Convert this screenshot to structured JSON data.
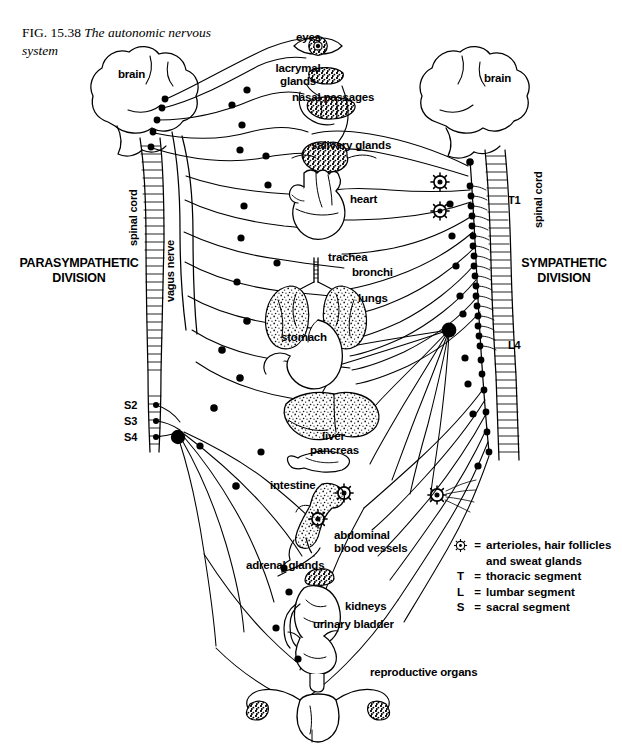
{
  "figure": {
    "number_prefix": "FIG.",
    "number": "15.38",
    "title": "The autonomic nervous system",
    "width": 622,
    "height": 745,
    "background": "#ffffff",
    "ink": "#000000"
  },
  "divisions": [
    {
      "name": "parasympathetic",
      "line1": "PARASYMPATHETIC",
      "line2": "DIVISION",
      "x": 14,
      "y": 256
    },
    {
      "name": "sympathetic",
      "line1": "SYMPATHETIC",
      "line2": "DIVISION",
      "x": 512,
      "y": 256
    }
  ],
  "structures": [
    {
      "name": "brain-left",
      "label": "brain",
      "x": 118,
      "y": 68
    },
    {
      "name": "brain-right",
      "label": "brain",
      "x": 484,
      "y": 72
    },
    {
      "name": "spinal-cord-left",
      "label": "spinal cord",
      "x": 121,
      "y": 200,
      "rotated": true
    },
    {
      "name": "vagus-nerve",
      "label": "vagus nerve",
      "x": 159,
      "y": 258,
      "rotated": true
    },
    {
      "name": "spinal-cord-right",
      "label": "spinal cord",
      "x": 527,
      "y": 165,
      "rotated": true
    },
    {
      "name": "eyes",
      "label": "eyes",
      "x": 296,
      "y": 31
    },
    {
      "name": "lacrymal-glands",
      "label": "lacrymal\nglands",
      "x": 265,
      "y": 62
    },
    {
      "name": "nasal-passages",
      "label": "nasal passages",
      "x": 292,
      "y": 91
    },
    {
      "name": "salivary-glands",
      "label": "salivary glands",
      "x": 311,
      "y": 139
    },
    {
      "name": "heart",
      "label": "heart",
      "x": 350,
      "y": 193
    },
    {
      "name": "trachea",
      "label": "trachea",
      "x": 328,
      "y": 258
    },
    {
      "name": "bronchi",
      "label": "bronchi",
      "x": 352,
      "y": 272
    },
    {
      "name": "lungs",
      "label": "lungs",
      "x": 358,
      "y": 298
    },
    {
      "name": "stomach",
      "label": "stomach",
      "x": 281,
      "y": 333
    },
    {
      "name": "liver",
      "label": "liver",
      "x": 322,
      "y": 430
    },
    {
      "name": "pancreas",
      "label": "pancreas",
      "x": 314,
      "y": 446
    },
    {
      "name": "intestine",
      "label": "intestine",
      "x": 272,
      "y": 484
    },
    {
      "name": "abdominal-blood-vessels",
      "label": "abdominal\nblood vessels",
      "x": 334,
      "y": 533
    },
    {
      "name": "adrenal-glands",
      "label": "adrenal glands",
      "x": 248,
      "y": 563
    },
    {
      "name": "kidneys",
      "label": "kidneys",
      "x": 345,
      "y": 605
    },
    {
      "name": "urinary-bladder",
      "label": "urinary bladder",
      "x": 315,
      "y": 622
    },
    {
      "name": "reproductive-organs",
      "label": "reproductive organs",
      "x": 372,
      "y": 670
    }
  ],
  "segment_markers": [
    {
      "name": "T1",
      "label": "T1",
      "x": 508,
      "y": 194,
      "side": "sympathetic"
    },
    {
      "name": "L4",
      "label": "L4",
      "x": 508,
      "y": 339,
      "side": "sympathetic"
    },
    {
      "name": "S2",
      "label": "S2",
      "x": 124,
      "y": 399,
      "side": "parasympathetic"
    },
    {
      "name": "S3",
      "label": "S3",
      "x": 124,
      "y": 415,
      "side": "parasympathetic"
    },
    {
      "name": "S4",
      "label": "S4",
      "x": 124,
      "y": 431,
      "side": "parasympathetic"
    }
  ],
  "legend": {
    "rows": [
      {
        "symbol": "star-wheel-icon",
        "symbol_text": "",
        "equals": "=",
        "text": "arterioles, hair follicles"
      },
      {
        "symbol": "",
        "symbol_text": "",
        "equals": "",
        "text": "and sweat glands"
      },
      {
        "symbol": "",
        "symbol_text": "T",
        "equals": "=",
        "text": "thoracic segment"
      },
      {
        "symbol": "",
        "symbol_text": "L",
        "equals": "=",
        "text": "lumbar segment"
      },
      {
        "symbol": "",
        "symbol_text": "S",
        "equals": "=",
        "text": "sacral segment"
      }
    ]
  }
}
